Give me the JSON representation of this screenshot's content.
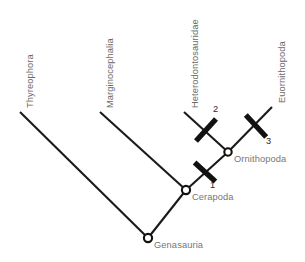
{
  "diagram": {
    "type": "cladogram",
    "line_color": "#1a1a1a",
    "label_color": "#6e6e6e",
    "marker_color": "#111111",
    "background_color": "#ffffff"
  },
  "taxa": [
    {
      "id": "thyreophora",
      "label": "Thyreophora",
      "tip_x": 20,
      "tip_y": 112
    },
    {
      "id": "marginocephalia",
      "label": "Marginocephalia",
      "tip_x": 100,
      "tip_y": 112
    },
    {
      "id": "heterodontosauridae",
      "label": "Heterodontosauridae",
      "tip_x": 184,
      "tip_y": 112
    },
    {
      "id": "euornithopoda",
      "label": "Euornithopoda",
      "tip_x": 272,
      "tip_y": 107
    }
  ],
  "nodes": [
    {
      "id": "genasauria",
      "label": "Genasauria",
      "x": 148,
      "y": 238
    },
    {
      "id": "cerapoda",
      "label": "Cerapoda",
      "x": 186,
      "y": 190
    },
    {
      "id": "ornithopoda",
      "label": "Ornithopoda",
      "x": 228,
      "y": 152
    }
  ],
  "branches": [
    {
      "id": "genasauria-to-thyreophora",
      "from": "genasauria",
      "to": "thyreophora"
    },
    {
      "id": "genasauria-to-cerapoda",
      "from": "genasauria",
      "to": "cerapoda"
    },
    {
      "id": "cerapoda-to-marginocephalia",
      "from": "cerapoda",
      "to": "marginocephalia"
    },
    {
      "id": "cerapoda-to-ornithopoda",
      "from": "cerapoda",
      "to": "ornithopoda"
    },
    {
      "id": "ornithopoda-to-heterodontosauridae",
      "from": "ornithopoda",
      "to": "heterodontosauridae"
    },
    {
      "id": "ornithopoda-to-euornithopoda",
      "from": "ornithopoda",
      "to": "euornithopoda"
    }
  ],
  "markers": [
    {
      "id": "marker-1",
      "label": "1",
      "branch": "cerapoda-to-ornithopoda",
      "x": 205,
      "y": 172,
      "label_x": 210,
      "label_y": 180
    },
    {
      "id": "marker-2",
      "label": "2",
      "branch": "ornithopoda-to-heterodontosauridae",
      "x": 206,
      "y": 130,
      "label_x": 213,
      "label_y": 104
    },
    {
      "id": "marker-3",
      "label": "3",
      "branch": "ornithopoda-to-euornithopoda",
      "x": 256,
      "y": 126,
      "label_x": 266,
      "label_y": 136
    }
  ],
  "taxon_label_positions": [
    {
      "id": "thyreophora",
      "x": 25,
      "y": 108
    },
    {
      "id": "marginocephalia",
      "x": 105,
      "y": 108
    },
    {
      "id": "heterodontosauridae",
      "x": 190,
      "y": 108
    },
    {
      "id": "euornithopoda",
      "x": 277,
      "y": 103
    }
  ],
  "node_label_positions": [
    {
      "id": "genasauria",
      "x": 154,
      "y": 240
    },
    {
      "id": "cerapoda",
      "x": 192,
      "y": 192
    },
    {
      "id": "ornithopoda",
      "x": 234,
      "y": 154
    }
  ]
}
